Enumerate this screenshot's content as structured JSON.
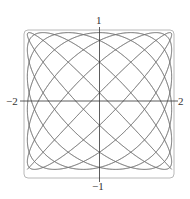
{
  "chart_data": {
    "type": "line",
    "title": "",
    "xlabel": "",
    "ylabel": "",
    "xlim": [
      -2,
      2
    ],
    "ylim": [
      -1,
      1
    ],
    "x_ticks": [
      "-2",
      "2"
    ],
    "y_ticks": [
      "1",
      "-1"
    ],
    "grid": false,
    "legend": null,
    "series": [
      {
        "name": "parametric curve",
        "param": "t",
        "t_range": [
          0,
          6.2832
        ],
        "x_expr": "2*sin(13t) ... approx Lissajous",
        "y_expr": "cos(14t) approx",
        "a": 13,
        "b": 14,
        "x_amp": 1.95,
        "y_amp": 0.95
      }
    ]
  },
  "labels": {
    "x_min": "−2",
    "x_max": "2",
    "y_max": "1",
    "y_min": "−1"
  },
  "colors": {
    "curve": "#707070",
    "axis": "#333333",
    "frame": "#b0b0b0"
  }
}
